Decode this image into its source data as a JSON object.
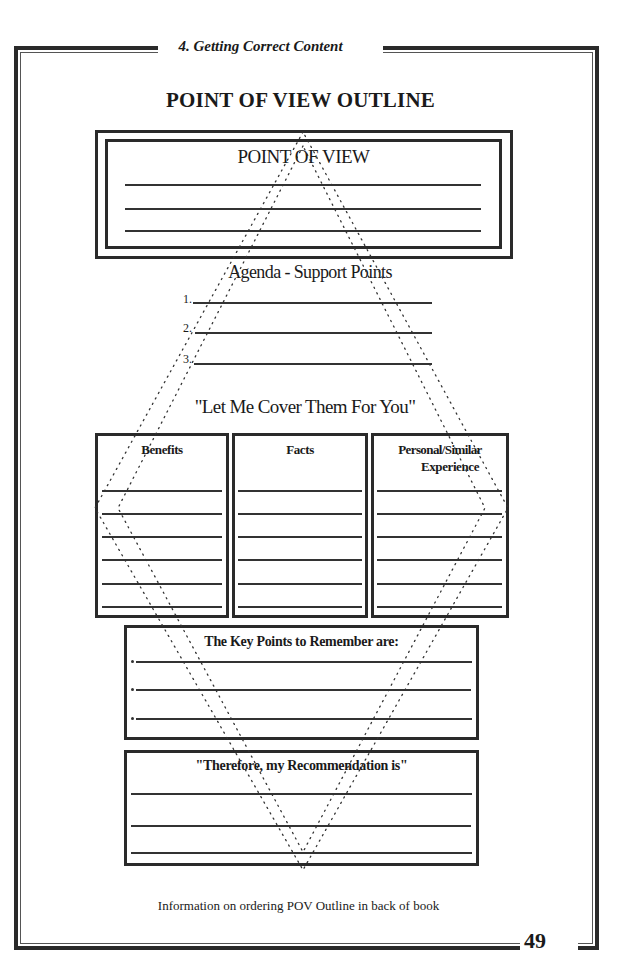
{
  "page": {
    "running_head": "4. Getting Correct Content",
    "title": "POINT OF VIEW OUTLINE",
    "page_number": "49",
    "footer_note": "Information on ordering POV Outline in back of book"
  },
  "form": {
    "point_of_view": {
      "heading": "POINT OF VIEW",
      "blank_lines": 3
    },
    "agenda": {
      "heading": "Agenda - Support Points",
      "items": [
        {
          "number": "1.",
          "value": ""
        },
        {
          "number": "2.",
          "value": ""
        },
        {
          "number": "3.",
          "value": ""
        }
      ]
    },
    "transition": "\"Let Me Cover Them For You\"",
    "columns": [
      {
        "heading_line1": "Benefits",
        "heading_line2": "",
        "blank_lines": 6
      },
      {
        "heading_line1": "Facts",
        "heading_line2": "",
        "blank_lines": 6
      },
      {
        "heading_line1": "Personal/Similar",
        "heading_line2": "Experience",
        "blank_lines": 6
      }
    ],
    "key_points": {
      "heading": "The Key Points to Remember are:",
      "bullet_lines": 3
    },
    "recommendation": {
      "heading": "\"Therefore, my Recommendation is\"",
      "blank_lines": 3
    }
  },
  "colors": {
    "ink": "#2a2a2a",
    "paper": "#ffffff"
  }
}
